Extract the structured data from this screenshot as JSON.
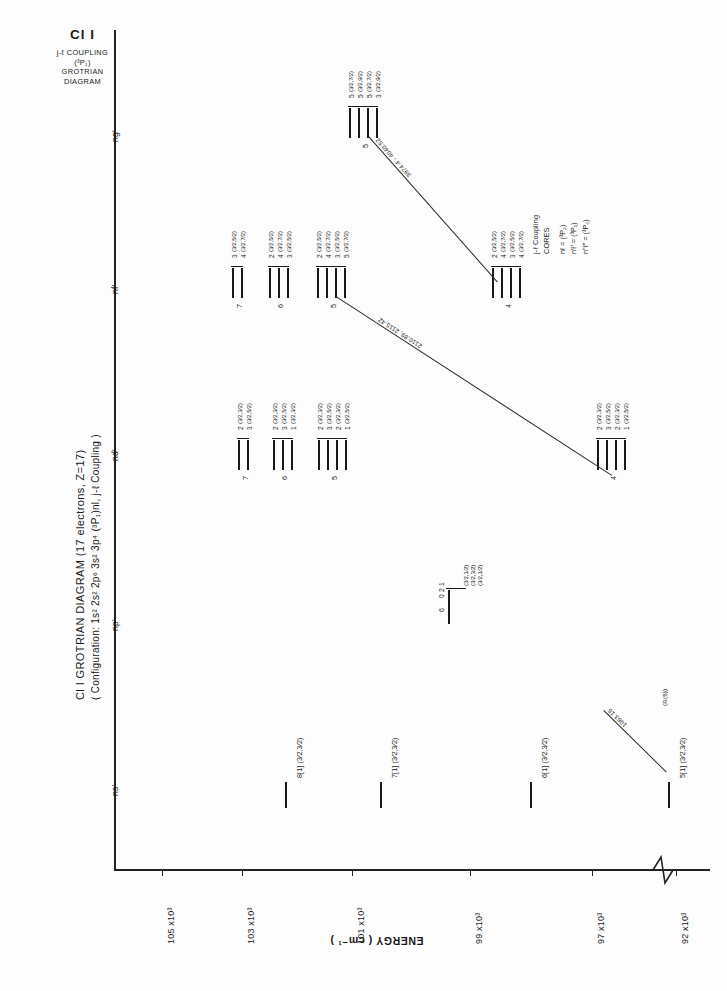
{
  "header": {
    "species": "Cl I",
    "coupling_line": "j-ℓ COUPLING",
    "core_line": "(³P₁)",
    "type_line_1": "GROTRIAN",
    "type_line_2": "DIAGRAM"
  },
  "captions": {
    "main": "Cl I GROTRIAN DIAGRAM (17 electrons, Z=17)",
    "sub": "( Configuration: 1s² 2s² 2p⁶ 3s² 3p⁴ (³P₁)nl, j-ℓ Coupling )",
    "energy_axis": "ENERGY ( cm⁻¹ )"
  },
  "axis": {
    "ticks": [
      {
        "label": "105 x10³",
        "value": 105000,
        "x": 162
      },
      {
        "label": "103 x10³",
        "value": 103000,
        "x": 242
      },
      {
        "label": "101 x10³",
        "value": 101000,
        "x": 352
      },
      {
        "label": "99 x10³",
        "value": 99000,
        "x": 470
      },
      {
        "label": "97 x10³",
        "value": 97000,
        "x": 592
      },
      {
        "label": "92 x10³",
        "value": 92000,
        "x": 676
      }
    ],
    "break_symbol": "axis-break"
  },
  "columns": [
    {
      "name": "ng'",
      "label": "ng'",
      "y": 128
    },
    {
      "name": "nf'",
      "label": "nf'",
      "y": 280
    },
    {
      "name": "nd'",
      "label": "nd'",
      "y": 447
    },
    {
      "name": "np'",
      "label": "np'",
      "y": 617
    },
    {
      "name": "ns'",
      "label": "ns'",
      "y": 782
    }
  ],
  "legend": {
    "title_1": "j-ℓ Coupling",
    "title_2": "CORES",
    "rows": [
      {
        "left": "nℓ =",
        "right": "(³P₂)"
      },
      {
        "left": "n'ℓ' =",
        "right": "(³P₁)"
      },
      {
        "left": "n\"ℓ\" =",
        "right": "(³P₀)"
      }
    ]
  },
  "levels": {
    "ns": [
      {
        "n": "8",
        "label": "8[1] (³⁄₂,³⁄₂)",
        "x": 285,
        "y": 762,
        "len": 26
      },
      {
        "n": "7",
        "label": "7[1] (³⁄₂,³⁄₂)",
        "x": 380,
        "y": 762,
        "len": 26
      },
      {
        "n": "6",
        "label": "6[1] (³⁄₂,³⁄₂)",
        "x": 530,
        "y": 762,
        "len": 26
      },
      {
        "n": "5",
        "label": "5[1] (³⁄₂,³⁄₂)",
        "x": 668,
        "y": 762,
        "len": 26
      }
    ],
    "np": [
      {
        "n": "6",
        "x": 448,
        "terms": [
          "1",
          "2",
          "0"
        ],
        "jlabels": [
          "(³⁄₂,¹⁄₂)",
          "(³⁄₂,³⁄₂)",
          "(³⁄₂,¹⁄₂)"
        ]
      }
    ],
    "nd": [
      {
        "n": "7",
        "x": 241
      },
      {
        "n": "6",
        "x": 276
      },
      {
        "n": "5",
        "x": 322
      },
      {
        "n": "4",
        "x": 600
      }
    ],
    "nf": [
      {
        "n": "7",
        "x": 235
      },
      {
        "n": "6",
        "x": 272
      },
      {
        "n": "5",
        "x": 320
      },
      {
        "n": "4",
        "x": 495
      }
    ],
    "ng": [
      {
        "n": "5",
        "x": 352
      }
    ]
  },
  "transitions": [
    {
      "name": "ng-nf",
      "label": "3974.4 - 4040.52",
      "x1": 368,
      "y1": 135,
      "x2": 498,
      "y2": 282
    },
    {
      "name": "nf-nd",
      "label": "2110.89, 2115.42",
      "x1": 336,
      "y1": 296,
      "x2": 612,
      "y2": 475
    },
    {
      "name": "ns-transition",
      "label": "1063.16",
      "label2": "(R(5))",
      "x1": 604,
      "y1": 710,
      "x2": 667,
      "y2": 772
    }
  ]
}
